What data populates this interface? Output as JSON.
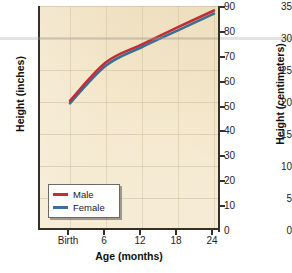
{
  "chart_data": {
    "type": "line",
    "title": "",
    "subtitle": "",
    "xlabel": "Age (months)",
    "ylabel": "Height (inches)",
    "ylabel_secondary": "Height (centimeters)",
    "x": [
      0,
      6,
      12,
      18,
      24
    ],
    "categories": [
      "Birth",
      "6",
      "12",
      "18",
      "24"
    ],
    "xtick_labels": [
      "Birth",
      "6",
      "12",
      "18",
      "24"
    ],
    "ytick_labels_left": [
      "0",
      "5",
      "10",
      "15",
      "20",
      "25",
      "30",
      "35"
    ],
    "ytick_values_left": [
      0,
      5,
      10,
      15,
      20,
      25,
      30,
      35
    ],
    "ytick_labels_right": [
      "0",
      "10",
      "20",
      "30",
      "40",
      "50",
      "60",
      "70",
      "80",
      "90"
    ],
    "ytick_values_right": [
      0,
      10,
      20,
      30,
      40,
      50,
      60,
      70,
      80,
      90
    ],
    "ylim": [
      0,
      35
    ],
    "ylim_secondary": [
      0,
      90
    ],
    "xlim": [
      0,
      24
    ],
    "grid": true,
    "legend_position": "lower left",
    "series": [
      {
        "name": "Male",
        "color": "#bf2f35",
        "values": [
          20.2,
          26.2,
          29.0,
          31.7,
          34.3
        ]
      },
      {
        "name": "Female",
        "color": "#3a6f96",
        "values": [
          19.8,
          25.7,
          28.6,
          31.2,
          33.8
        ]
      }
    ]
  },
  "axes": {
    "left": {
      "title": "Height (inches)",
      "ticks": [
        "35",
        "30",
        "25",
        "20",
        "15",
        "10",
        "5",
        "0"
      ]
    },
    "right": {
      "title": "Height (centimeters)",
      "ticks": [
        "90",
        "80",
        "70",
        "60",
        "50",
        "40",
        "30",
        "20",
        "10",
        "0"
      ]
    },
    "bottom": {
      "title": "Age (months)",
      "ticks": [
        "Birth",
        "6",
        "12",
        "18",
        "24"
      ]
    }
  },
  "legend": {
    "items": [
      {
        "label": "Male",
        "color": "#bf2f35"
      },
      {
        "label": "Female",
        "color": "#3a6f96"
      }
    ]
  },
  "colors": {
    "male": "#bf2f35",
    "female": "#3a6f96",
    "plot_background": "#f3e6c9",
    "axis": "#34302a",
    "page_background": "#ffffff"
  }
}
